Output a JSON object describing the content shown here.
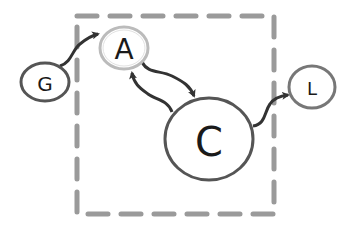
{
  "diagram": {
    "boundary": {
      "style": "dashed",
      "color": "#9a9a9a"
    },
    "nodes": [
      {
        "id": "G",
        "label": "G"
      },
      {
        "id": "A",
        "label": "A"
      },
      {
        "id": "C",
        "label": "C"
      },
      {
        "id": "L",
        "label": "L"
      }
    ],
    "edges": [
      {
        "from": "G",
        "to": "A"
      },
      {
        "from": "A",
        "to": "C"
      },
      {
        "from": "C",
        "to": "A"
      },
      {
        "from": "C",
        "to": "L"
      }
    ],
    "colors": {
      "edge": "#333333",
      "node_border": "#555555",
      "node_a_border": "#bbbbbb"
    }
  }
}
